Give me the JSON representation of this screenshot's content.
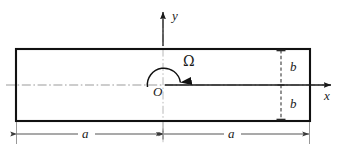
{
  "figure": {
    "type": "mechanics-schematic",
    "colors": {
      "outline": "#111111",
      "centerline": "#8a8a8a",
      "dimension": "#4a4a4a",
      "axis": "#1a1a1a",
      "background": "#ffffff"
    },
    "labels": {
      "y_axis": "y",
      "x_axis": "x",
      "origin": "O",
      "omega": "Ω",
      "dim_half_width_left": "a",
      "dim_half_width_right": "a",
      "dim_half_height_top": "b",
      "dim_half_height_bottom": "b"
    },
    "geometry": {
      "rect_left": 16,
      "rect_right": 310,
      "rect_top": 49,
      "rect_bottom": 121,
      "origin_x": 163,
      "origin_y": 85,
      "y_axis_top": 10,
      "x_axis_right": 334,
      "b_dimension_x": 281,
      "a_dimension_y": 134
    }
  }
}
